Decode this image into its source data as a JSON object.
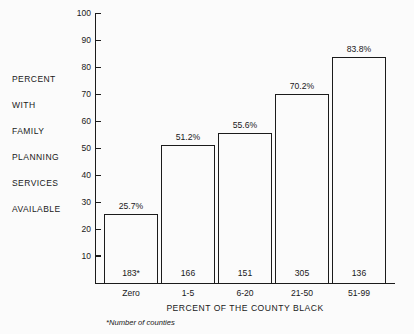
{
  "chart_data": {
    "type": "bar",
    "title": "",
    "categories": [
      "Zero",
      "1-5",
      "6-20",
      "21-50",
      "51-99"
    ],
    "values": [
      25.7,
      51.2,
      55.6,
      70.2,
      83.8
    ],
    "value_labels": [
      "25.7%",
      "51.2%",
      "55.6%",
      "70.2%",
      "83.8%"
    ],
    "counts": [
      "183*",
      "166",
      "151",
      "305",
      "136"
    ],
    "xlabel": "PERCENT OF THE COUNTY BLACK",
    "ylabel": "PERCENT WITH FAMILY PLANNING SERVICES AVAILABLE",
    "ylim": [
      0,
      100
    ],
    "ytick_labels": [
      "100",
      "90",
      "80",
      "70",
      "60",
      "50",
      "40",
      "30",
      "20",
      "10"
    ],
    "ytick_values": [
      100,
      90,
      80,
      70,
      60,
      50,
      40,
      30,
      20,
      10
    ],
    "grid": false,
    "legend": "none",
    "footnote": "*Number of counties",
    "bar_fill": "#fbfbfb",
    "bar_stroke": "#1b1b1b",
    "axis_color": "#1b1b1b",
    "background": "#fbfbfb"
  },
  "side_caption": {
    "lines": [
      "PERCENT",
      "WITH",
      "FAMILY",
      "PLANNING",
      "SERVICES",
      "AVAILABLE"
    ]
  }
}
